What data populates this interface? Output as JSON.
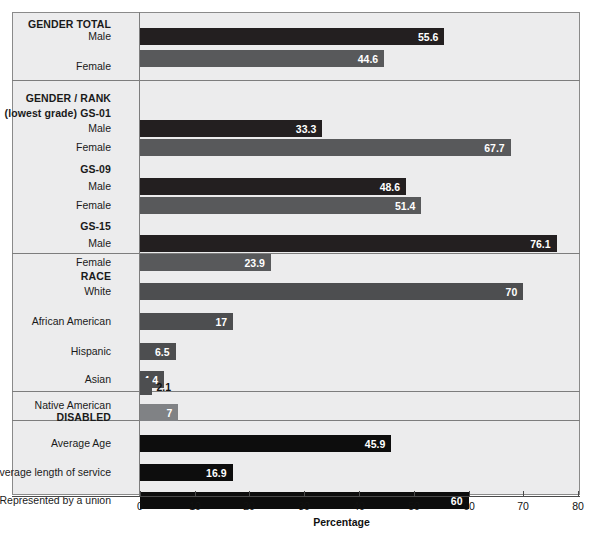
{
  "chart_data": {
    "type": "bar",
    "title": "",
    "subtitle": "",
    "xlabel": "Percentage",
    "ylabel": "",
    "xlim": [
      0,
      80
    ],
    "xticks": [
      0,
      10,
      20,
      30,
      40,
      50,
      60,
      70,
      80
    ],
    "orientation": "horizontal",
    "grid": false,
    "legend": "none",
    "colors": {
      "male": "#231f20",
      "female": "#58595b",
      "race": "#4d4e50",
      "disabled": "#808285",
      "metric": "#0d0d0d",
      "panel_background": "#ececed",
      "frame": "#8a8a8a"
    },
    "sections": [
      {
        "id": "gender-total",
        "heading": "GENDER TOTAL",
        "heading_lines": [
          "GENDER TOTAL"
        ],
        "bars": [
          {
            "label": "Male",
            "value": 55.6,
            "value_text": "55.6",
            "series": "male",
            "label_inside": true
          },
          {
            "label": "Female",
            "value": 44.6,
            "value_text": "44.6",
            "series": "female",
            "label_inside": true
          }
        ]
      },
      {
        "id": "gender-rank",
        "heading": "GENDER/RANK",
        "heading_lines": [
          "GENDER / RANK",
          "(lowest grade) GS-01"
        ],
        "bars": [
          {
            "label": "Male",
            "value": 33.3,
            "value_text": "33.3",
            "series": "male",
            "label_inside": true
          },
          {
            "label": "Female",
            "value": 67.7,
            "value_text": "67.7",
            "series": "female",
            "label_inside": true
          },
          {
            "label": "GS-09",
            "value": null,
            "value_text": "",
            "series": "subheading",
            "label_inside": false
          },
          {
            "label": "Male",
            "value": 48.6,
            "value_text": "48.6",
            "series": "male",
            "label_inside": true
          },
          {
            "label": "Female",
            "value": 51.4,
            "value_text": "51.4",
            "series": "female",
            "label_inside": true
          },
          {
            "label": "GS-15",
            "value": null,
            "value_text": "",
            "series": "subheading",
            "label_inside": false
          },
          {
            "label": "Male",
            "value": 76.1,
            "value_text": "76.1",
            "series": "male",
            "label_inside": true
          },
          {
            "label": "Female",
            "value": 23.9,
            "value_text": "23.9",
            "series": "female",
            "label_inside": true
          }
        ]
      },
      {
        "id": "race",
        "heading": "RACE",
        "heading_lines": [
          "RACE"
        ],
        "bars": [
          {
            "label": "White",
            "value": 70,
            "value_text": "70",
            "series": "race",
            "label_inside": true
          },
          {
            "label": "African American",
            "value": 17,
            "value_text": "17",
            "series": "race",
            "label_inside": true
          },
          {
            "label": "Hispanic",
            "value": 6.5,
            "value_text": "6.5",
            "series": "race",
            "label_inside": true
          },
          {
            "label": "Asian",
            "value": 4.4,
            "value_text": "4.4",
            "series": "race",
            "label_inside": true
          },
          {
            "label": "Native American",
            "value": 2.1,
            "value_text": "2.1",
            "series": "race",
            "label_inside": false
          }
        ]
      },
      {
        "id": "disabled",
        "heading": "DISABLED",
        "heading_lines": [
          "DISABLED"
        ],
        "bars": [
          {
            "label": "DISABLED",
            "value": 7,
            "value_text": "7",
            "series": "disabled",
            "label_inside": true
          }
        ]
      },
      {
        "id": "other-metrics",
        "heading": "",
        "heading_lines": [],
        "bars": [
          {
            "label": "Average Age",
            "value": 45.9,
            "value_text": "45.9",
            "series": "metric",
            "label_inside": true
          },
          {
            "label": "Average length of service",
            "value": 16.9,
            "value_text": "16.9",
            "series": "metric",
            "label_inside": true
          },
          {
            "label": "Represented by a union",
            "value": 60,
            "value_text": "60",
            "series": "metric",
            "label_inside": true
          }
        ]
      }
    ]
  },
  "labels": {
    "gender_total_heading": "GENDER TOTAL",
    "gt_male": "Male",
    "gt_female": "Female",
    "gt_male_value": "55.6",
    "gt_female_value": "44.6",
    "gender_rank_heading_1": "GENDER / RANK",
    "gender_rank_heading_2": "(lowest grade) GS-01",
    "gs01_male": "Male",
    "gs01_female": "Female",
    "gs01_male_value": "33.3",
    "gs01_female_value": "67.7",
    "gs09_heading": "GS-09",
    "gs09_male": "Male",
    "gs09_female": "Female",
    "gs09_male_value": "48.6",
    "gs09_female_value": "51.4",
    "gs15_heading": "GS-15",
    "gs15_male": "Male",
    "gs15_female": "Female",
    "gs15_male_value": "76.1",
    "gs15_female_value": "23.9",
    "race_heading": "RACE",
    "race_white": "White",
    "race_white_value": "70",
    "race_african_american": "African American",
    "race_african_american_value": "17",
    "race_hispanic": "Hispanic",
    "race_hispanic_value": "6.5",
    "race_asian": "Asian",
    "race_asian_value": "4.4",
    "race_native_american": "Native American",
    "race_native_american_value": "2.1",
    "disabled_heading": "DISABLED",
    "disabled_value": "7",
    "average_age": "Average Age",
    "average_age_value": "45.9",
    "average_length_of_service": "Average length of service",
    "average_length_of_service_value": "16.9",
    "represented_by_a_union": "Represented by a union",
    "represented_by_a_union_value": "60"
  },
  "axis": {
    "title": "Percentage",
    "ticks": [
      "0",
      "10",
      "20",
      "30",
      "40",
      "50",
      "60",
      "70",
      "80"
    ]
  }
}
